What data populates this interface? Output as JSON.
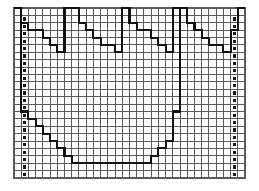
{
  "figure": {
    "title": "",
    "background_color": "#ffffff",
    "grid_line_color": "#5a5a5a",
    "grid_minor_color": "#9a9a9a",
    "plot_line_color": "#111111",
    "marker_color": "#1a1a1a",
    "frame": {
      "x": 14,
      "y": 8,
      "width": 231,
      "height": 170
    },
    "grid": {
      "columns": 32,
      "rows": 23,
      "cell_width": 7.22,
      "cell_height": 7.39
    }
  },
  "chart_data": {
    "type": "line",
    "title": "",
    "xlabel": "",
    "ylabel": "",
    "grid": true,
    "legend": false,
    "xlim": [
      0,
      32
    ],
    "ylim": [
      0,
      23
    ],
    "series": [
      {
        "name": "upper-crown-profile",
        "step": "post",
        "x": [
          0,
          1,
          1,
          2,
          2,
          4,
          4,
          5,
          5,
          6,
          6,
          7,
          7,
          9,
          9,
          10,
          10,
          11,
          11,
          12,
          12,
          14,
          14,
          15,
          15,
          16,
          16,
          17,
          17,
          19,
          19,
          20,
          20,
          21,
          21,
          22,
          22,
          24,
          24,
          25,
          25,
          26,
          26,
          27,
          27,
          29,
          29,
          30,
          30,
          31,
          31,
          32
        ],
        "y": [
          23,
          23,
          21,
          21,
          20,
          20,
          19,
          19,
          18,
          18,
          17,
          17,
          23,
          23,
          21,
          21,
          20,
          20,
          19,
          19,
          18,
          18,
          17,
          17,
          23,
          23,
          21,
          21,
          20,
          20,
          19,
          19,
          18,
          18,
          17,
          17,
          23,
          23,
          21,
          21,
          20,
          20,
          19,
          19,
          18,
          18,
          17,
          17,
          20,
          20,
          23,
          23
        ]
      },
      {
        "name": "lower-basin-profile",
        "step": "post",
        "x": [
          1,
          1,
          2,
          2,
          3,
          3,
          4,
          4,
          5,
          5,
          6,
          6,
          7,
          7,
          8,
          8,
          9,
          9,
          10,
          10,
          11,
          11,
          12,
          12,
          14,
          14,
          19,
          19,
          20,
          20,
          21,
          21,
          22,
          22,
          23,
          23
        ],
        "y": [
          23,
          9,
          9,
          8,
          8,
          7,
          7,
          6,
          6,
          5,
          5,
          4,
          4,
          3,
          3,
          2,
          2,
          2,
          2,
          2,
          2,
          2,
          2,
          2,
          2,
          2,
          2,
          3,
          3,
          4,
          4,
          5,
          5,
          9,
          9,
          23
        ]
      }
    ],
    "markers": {
      "name": "row-tick-markers",
      "description": "small filled squares in the second column from the left and the second column from the right, one per grid row",
      "left_column_index": 1,
      "right_column_index": 30,
      "row_start": 1,
      "row_end": 22
    }
  },
  "labels": {
    "figure_name": "graph-paper-plot",
    "alt": "Graph-paper grid with a thick stepped polyline forming a repeating jagged crown across the top and a wide flat-bottomed basin below, with dotted tick-marker columns at the left and right edges."
  }
}
